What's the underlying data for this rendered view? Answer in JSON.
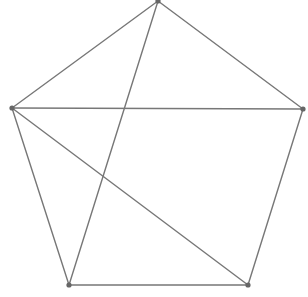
{
  "diagram": {
    "type": "graph",
    "width": 308,
    "height": 297,
    "colors": {
      "background": "#ffffff",
      "edge": "#777777",
      "node": "#666666"
    },
    "edge_width": 1.4,
    "node_radius": 2.6,
    "nodes": [
      {
        "id": "top",
        "x": 158,
        "y": 1
      },
      {
        "id": "left",
        "x": 12,
        "y": 108
      },
      {
        "id": "right",
        "x": 303,
        "y": 109
      },
      {
        "id": "bottom-left",
        "x": 69,
        "y": 285
      },
      {
        "id": "bottom-right",
        "x": 248,
        "y": 285
      }
    ],
    "edges": [
      {
        "from": "top",
        "to": "left"
      },
      {
        "from": "top",
        "to": "right"
      },
      {
        "from": "left",
        "to": "right"
      },
      {
        "from": "left",
        "to": "bottom-left"
      },
      {
        "from": "right",
        "to": "bottom-right"
      },
      {
        "from": "bottom-left",
        "to": "bottom-right"
      },
      {
        "from": "top",
        "to": "bottom-left"
      },
      {
        "from": "left",
        "to": "bottom-right"
      }
    ]
  }
}
